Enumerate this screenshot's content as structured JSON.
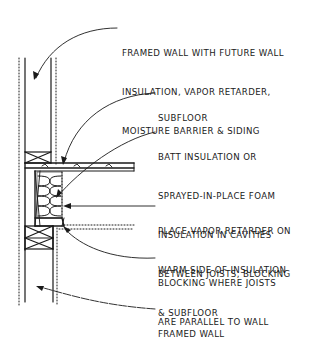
{
  "diagram": {
    "colors": {
      "line": "#1a1a1a",
      "background": "#ffffff"
    },
    "callouts": [
      {
        "id": "framed-wall-future",
        "lines": [
          "FRAMED WALL WITH FUTURE WALL",
          "INSULATION, VAPOR RETARDER,",
          "MOISTURE BARRIER & SIDING"
        ]
      },
      {
        "id": "subfloor",
        "lines": [
          "SUBFLOOR"
        ]
      },
      {
        "id": "batt-insulation",
        "lines": [
          "BATT INSULATION OR",
          "SPRAYED-IN-PLACE FOAM",
          "INSULATION IN CAVITIES",
          "BETWEEN JOISTS, BLOCKING",
          "& SUBFLOOR"
        ]
      },
      {
        "id": "vapor-retarder",
        "lines": [
          "PLACE VAPOR RETARDER ON",
          "WARM SIDE OF INSULATION"
        ]
      },
      {
        "id": "blocking",
        "lines": [
          "BLOCKING WHERE JOISTS",
          "ARE PARALLEL TO WALL"
        ]
      },
      {
        "id": "framed-wall",
        "lines": [
          "FRAMED WALL"
        ]
      }
    ]
  }
}
